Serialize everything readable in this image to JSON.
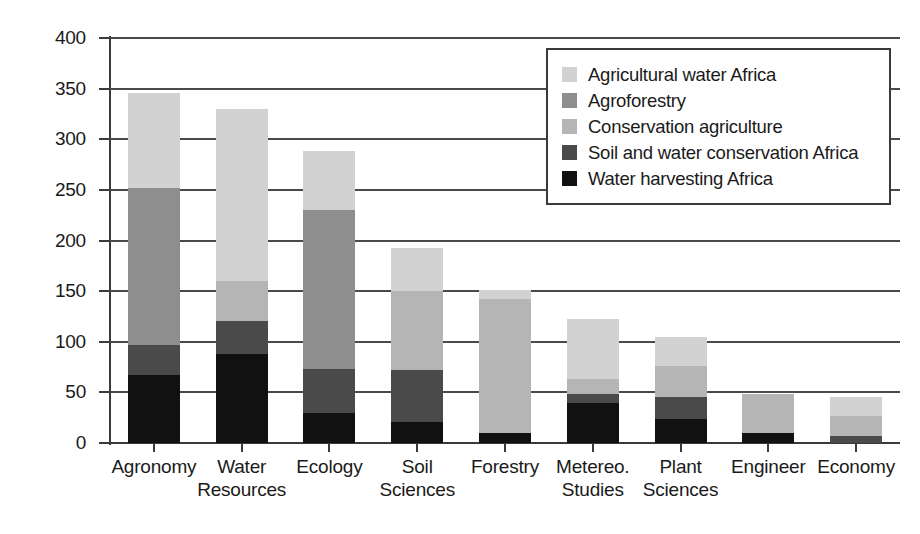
{
  "chart_data": {
    "type": "bar",
    "subtype": "stacked-bar",
    "title": "",
    "xlabel": "",
    "ylabel": "",
    "ylim": [
      0,
      400
    ],
    "ytick_step": 50,
    "ytick_labels": [
      "400",
      "350",
      "300",
      "250",
      "200",
      "150",
      "100",
      "50",
      "0"
    ],
    "ytick_values": [
      400,
      350,
      300,
      250,
      200,
      150,
      100,
      50,
      0
    ],
    "grid": true,
    "grid_axis": "y",
    "legend_position": "top-right",
    "categories": [
      "Agronomy",
      "Water Resources",
      "Ecology",
      "Soil Sciences",
      "Forestry",
      "Metereo. Studies",
      "Plant Sciences",
      "Engineer",
      "Economy"
    ],
    "category_lines": [
      [
        "Agronomy",
        ""
      ],
      [
        "Water",
        "Resources"
      ],
      [
        "Ecology",
        ""
      ],
      [
        "Soil",
        "Sciences"
      ],
      [
        "Forestry",
        ""
      ],
      [
        "Metereo.",
        "Studies"
      ],
      [
        "Plant",
        "Sciences"
      ],
      [
        "Engineer",
        ""
      ],
      [
        "Economy",
        ""
      ]
    ],
    "series": [
      {
        "name": "Water harvesting Africa",
        "color": "#111111",
        "values": [
          67,
          88,
          30,
          21,
          10,
          40,
          24,
          10,
          0
        ]
      },
      {
        "name": "Soil and water conservation Africa",
        "color": "#4a4a4a",
        "values": [
          30,
          33,
          43,
          51,
          0,
          8,
          21,
          0,
          7
        ]
      },
      {
        "name": "Conservation agriculture",
        "color": "#b5b5b5",
        "values": [
          0,
          39,
          0,
          78,
          132,
          15,
          31,
          38,
          20
        ]
      },
      {
        "name": "Agroforestry",
        "color": "#8e8e8e",
        "values": [
          155,
          0,
          157,
          0,
          0,
          0,
          0,
          0,
          0
        ]
      },
      {
        "name": "Agricultural water Africa",
        "color": "#d2d2d2",
        "values": [
          94,
          170,
          58,
          43,
          9,
          59,
          29,
          0,
          18
        ]
      }
    ],
    "totals": [
      346,
      330,
      288,
      193,
      151,
      122,
      105,
      48,
      45
    ],
    "stack_order_bottom_to_top": [
      "Water harvesting Africa",
      "Soil and water conservation Africa",
      "Conservation agriculture",
      "Agroforestry",
      "Agricultural water Africa"
    ],
    "bars": [
      {
        "category": "Agronomy",
        "total": 346,
        "segments": [
          {
            "name": "Water harvesting Africa",
            "value": 67,
            "color": "#111111"
          },
          {
            "name": "Soil and water conservation Africa",
            "value": 30,
            "color": "#4a4a4a"
          },
          {
            "name": "Agroforestry",
            "value": 155,
            "color": "#8e8e8e"
          },
          {
            "name": "Agricultural water Africa",
            "value": 94,
            "color": "#d2d2d2"
          }
        ]
      },
      {
        "category": "Water Resources",
        "total": 330,
        "segments": [
          {
            "name": "Water harvesting Africa",
            "value": 88,
            "color": "#111111"
          },
          {
            "name": "Soil and water conservation Africa",
            "value": 33,
            "color": "#4a4a4a"
          },
          {
            "name": "Conservation agriculture",
            "value": 39,
            "color": "#b5b5b5"
          },
          {
            "name": "Agricultural water Africa",
            "value": 170,
            "color": "#d2d2d2"
          }
        ]
      },
      {
        "category": "Ecology",
        "total": 288,
        "segments": [
          {
            "name": "Water harvesting Africa",
            "value": 30,
            "color": "#111111"
          },
          {
            "name": "Soil and water conservation Africa",
            "value": 43,
            "color": "#4a4a4a"
          },
          {
            "name": "Agroforestry",
            "value": 157,
            "color": "#8e8e8e"
          },
          {
            "name": "Agricultural water Africa",
            "value": 58,
            "color": "#d2d2d2"
          }
        ]
      },
      {
        "category": "Soil Sciences",
        "total": 193,
        "segments": [
          {
            "name": "Water harvesting Africa",
            "value": 21,
            "color": "#111111"
          },
          {
            "name": "Soil and water conservation Africa",
            "value": 51,
            "color": "#4a4a4a"
          },
          {
            "name": "Conservation agriculture",
            "value": 78,
            "color": "#b5b5b5"
          },
          {
            "name": "Agricultural water Africa",
            "value": 43,
            "color": "#d2d2d2"
          }
        ]
      },
      {
        "category": "Forestry",
        "total": 151,
        "segments": [
          {
            "name": "Water harvesting Africa",
            "value": 10,
            "color": "#111111"
          },
          {
            "name": "Conservation agriculture",
            "value": 132,
            "color": "#b5b5b5"
          },
          {
            "name": "Agricultural water Africa",
            "value": 9,
            "color": "#d2d2d2"
          }
        ]
      },
      {
        "category": "Metereo. Studies",
        "total": 122,
        "segments": [
          {
            "name": "Water harvesting Africa",
            "value": 40,
            "color": "#111111"
          },
          {
            "name": "Soil and water conservation Africa",
            "value": 8,
            "color": "#4a4a4a"
          },
          {
            "name": "Conservation agriculture",
            "value": 15,
            "color": "#b5b5b5"
          },
          {
            "name": "Agricultural water Africa",
            "value": 59,
            "color": "#d2d2d2"
          }
        ]
      },
      {
        "category": "Plant Sciences",
        "total": 105,
        "segments": [
          {
            "name": "Water harvesting Africa",
            "value": 24,
            "color": "#111111"
          },
          {
            "name": "Soil and water conservation Africa",
            "value": 21,
            "color": "#4a4a4a"
          },
          {
            "name": "Conservation agriculture",
            "value": 31,
            "color": "#b5b5b5"
          },
          {
            "name": "Agricultural water Africa",
            "value": 29,
            "color": "#d2d2d2"
          }
        ]
      },
      {
        "category": "Engineer",
        "total": 48,
        "segments": [
          {
            "name": "Water harvesting Africa",
            "value": 10,
            "color": "#111111"
          },
          {
            "name": "Conservation agriculture",
            "value": 38,
            "color": "#b5b5b5"
          }
        ]
      },
      {
        "category": "Economy",
        "total": 45,
        "segments": [
          {
            "name": "Soil and water conservation Africa",
            "value": 7,
            "color": "#4a4a4a"
          },
          {
            "name": "Conservation agriculture",
            "value": 20,
            "color": "#b5b5b5"
          },
          {
            "name": "Agricultural water Africa",
            "value": 18,
            "color": "#d2d2d2"
          }
        ]
      }
    ],
    "legend": [
      {
        "label": "Agricultural water Africa",
        "color": "#d2d2d2"
      },
      {
        "label": "Agroforestry",
        "color": "#8e8e8e"
      },
      {
        "label": "Conservation agriculture",
        "color": "#b5b5b5"
      },
      {
        "label": "Soil and water conservation Africa",
        "color": "#4a4a4a"
      },
      {
        "label": "Water harvesting Africa",
        "color": "#111111"
      }
    ]
  }
}
